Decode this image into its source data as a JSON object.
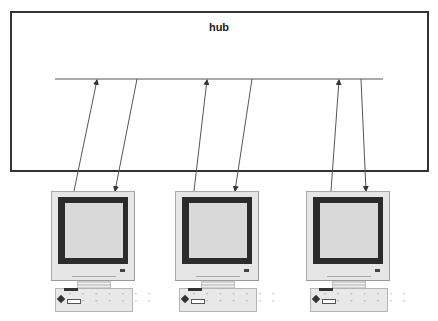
{
  "diagram": {
    "title": "hub",
    "hub_bus": {
      "x1": 55,
      "x2": 383,
      "y": 79
    },
    "computers": [
      {
        "name": "computer-1",
        "left": 51,
        "top": 191,
        "uplink": {
          "from": [
            74,
            191
          ],
          "to": [
            97,
            80
          ],
          "direction": "to-hub"
        },
        "downlink": {
          "from": [
            137,
            79
          ],
          "to": [
            115,
            191
          ],
          "direction": "to-computer"
        }
      },
      {
        "name": "computer-2",
        "left": 175,
        "top": 191,
        "uplink": {
          "from": [
            194,
            191
          ],
          "to": [
            207,
            80
          ],
          "direction": "to-hub"
        },
        "downlink": {
          "from": [
            252,
            79
          ],
          "to": [
            235,
            191
          ],
          "direction": "to-computer"
        }
      },
      {
        "name": "computer-3",
        "left": 306,
        "top": 191,
        "uplink": {
          "from": [
            331,
            191
          ],
          "to": [
            339,
            80
          ],
          "direction": "to-hub"
        },
        "downlink": {
          "from": [
            361,
            79
          ],
          "to": [
            366,
            191
          ],
          "direction": "to-computer"
        }
      }
    ],
    "keyboard_keys": "˘ ˘ ˘ ˘ ˘ ˘ ˘\n  ˘ ˘ ˘ ˘ ˘ ˘",
    "colors": {
      "line": "#444444",
      "box_border": "#333333",
      "monitor_frame": "#2b2b2b",
      "monitor_body": "#e6e6e6",
      "screen": "#d9d9d9"
    }
  }
}
